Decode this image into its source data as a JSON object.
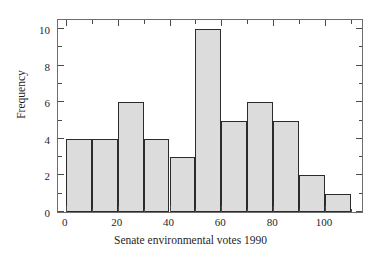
{
  "chart_data": {
    "type": "bar",
    "title": "",
    "subtitle": "",
    "xlabel": "Senate environmental votes 1990",
    "ylabel": "Frequency",
    "bin_width": 10,
    "bin_edges": [
      0,
      10,
      20,
      30,
      40,
      50,
      60,
      70,
      80,
      90,
      100,
      110
    ],
    "categories": [
      "0-10",
      "10-20",
      "20-30",
      "30-40",
      "40-50",
      "50-60",
      "60-70",
      "70-80",
      "80-90",
      "90-100",
      "100-110"
    ],
    "values": [
      4,
      4,
      6,
      4,
      3,
      10,
      5,
      6,
      5,
      2,
      1
    ],
    "xlim": [
      -3,
      115
    ],
    "ylim": [
      0,
      10.6
    ],
    "xticks": [
      0,
      20,
      40,
      60,
      80,
      100
    ],
    "xtick_labels": [
      "0",
      "20",
      "40",
      "60",
      "80",
      "100"
    ],
    "x_minor_ticks": [
      10,
      30,
      50,
      70,
      90,
      110
    ],
    "yticks": [
      0,
      2,
      4,
      6,
      8,
      10
    ],
    "ytick_labels": [
      "0",
      "2",
      "4",
      "6",
      "8",
      "10"
    ],
    "y_minor_ticks": [
      1,
      3,
      5,
      7,
      9
    ],
    "grid": false,
    "legend": null,
    "bar_fill_color": "#dcdcdc",
    "bar_edge_color": "#2b2b2b",
    "axis_color": "#6e6e6e",
    "background_color": "#ffffff",
    "total_count": 50
  }
}
